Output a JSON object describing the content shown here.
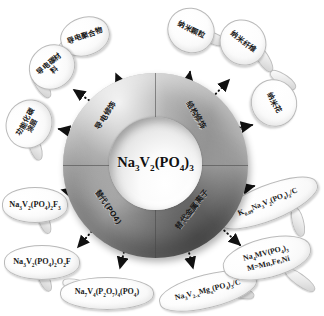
{
  "diagram": {
    "center": {
      "formula_html": "Na<sub>3</sub>V<sub>2</sub>(PO<sub>4</sub>)<sub>3</sub>",
      "formula_plain": "Na3V2(PO4)3"
    },
    "ring_labels": [
      {
        "id": "conductive-modification",
        "text": "导电修饰",
        "quadrant": "upper-left",
        "rotation": -58
      },
      {
        "id": "structural-modification",
        "text": "结构修饰",
        "quadrant": "upper-right",
        "rotation": 58
      },
      {
        "id": "po4-substitution",
        "text": "替代(PO4)",
        "quadrant": "lower-left",
        "rotation": 56
      },
      {
        "id": "metal-ion-substitution",
        "text": "替代金属离子",
        "quadrant": "lower-right",
        "rotation": -52
      }
    ],
    "bubbles": [
      {
        "id": "conductive-polymer",
        "text": "导电聚合物",
        "kind": "chinese",
        "rotation": -18
      },
      {
        "id": "conductive-carbon-material",
        "text": "导电碳材料",
        "kind": "chinese",
        "rotation": -40
      },
      {
        "id": "functionalized-carbon-coating",
        "text": "功能化碳涂层",
        "kind": "chinese",
        "rotation": -62
      },
      {
        "id": "nanoparticles",
        "text": "纳米颗粒",
        "kind": "chinese",
        "rotation": 26
      },
      {
        "id": "nanofibers",
        "text": "纳米纤维",
        "kind": "chinese",
        "rotation": 38
      },
      {
        "id": "nanoflower",
        "text": "纳米花",
        "kind": "chinese",
        "rotation": 62
      },
      {
        "id": "na3v2po42f3",
        "text_html": "Na<sub>3</sub>V<sub>2</sub>(PO<sub>4</sub>)<sub>2</sub>F<sub>3</sub>",
        "text_plain": "Na3V2(PO4)2F3",
        "kind": "formula",
        "rotation": 0
      },
      {
        "id": "na3v2po42o2f",
        "text_html": "Na<sub>3</sub>V<sub>2</sub>(PO<sub>4</sub>)<sub>2</sub>O<sub>2</sub>F",
        "text_plain": "Na3V2(PO4)2O2F",
        "kind": "formula",
        "rotation": 0
      },
      {
        "id": "na7v4p2o74po4",
        "text_html": "Na<sub>7</sub>V<sub>4</sub>(P<sub>2</sub>O<sub>7</sub>)<sub>4</sub>(PO<sub>4</sub>)",
        "text_plain": "Na7V4(P2O7)4(PO4)",
        "kind": "formula",
        "rotation": 0
      },
      {
        "id": "na3v2-xmgxpo43c",
        "text_html": "Na<sub>3</sub>V<sub>2-x</sub>Mg<sub>x</sub>(PO<sub>4</sub>)<sub>3</sub>/C",
        "text_plain": "Na3V2-xMgx(PO4)3/C",
        "kind": "formula",
        "rotation": -14
      },
      {
        "id": "na4mvpo43",
        "text_html": "Na<sub>4</sub>MV(PO<sub>4</sub>)<sub>3</sub><br>M=Mn,Fe,Ni",
        "text_plain": "Na4MV(PO4)3 M=Mn,Fe,Ni",
        "kind": "formula",
        "rotation": -14
      },
      {
        "id": "k009na3v2po43c",
        "text_html": "K<sub>0.09</sub>Na<sub>3</sub>V<sub>2</sub>(PO<sub>4</sub>)<sub>3</sub>/C",
        "text_plain": "K0.09Na3V2(PO4)3/C",
        "kind": "formula",
        "rotation": -22
      }
    ],
    "colors": {
      "background": "#ffffff",
      "torus_dark": "#7f7f7f",
      "torus_light": "#a8a8a8",
      "bubble_fill": "#fdfdfd",
      "bubble_stroke": "#b9b9b9",
      "arrow": "#111111",
      "text": "#1a1a1a"
    },
    "arrow_style": "dotted"
  }
}
